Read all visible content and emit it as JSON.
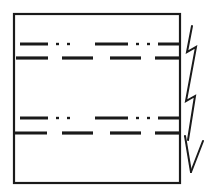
{
  "figure": {
    "title": "Hand-drawn sketch of a rectangular region with dash-dot stratification lines and a downward zigzag arrow",
    "kind": "line-drawing",
    "background_color": "#ffffff",
    "ink_color": "#1a1a1a",
    "canvas": {
      "width": 214,
      "height": 192
    }
  },
  "elements": {
    "frame": {
      "label": "rectangular outline box",
      "x": 14,
      "y": 14,
      "width": 166,
      "height": 169,
      "stroke_width": 2.2,
      "stroke_color": "#1a1a1a",
      "fill": "none"
    },
    "line_rows": [
      {
        "name": "dash-dot-dot-line-upper",
        "pattern": "dash-dot-dot",
        "y": 44,
        "stroke_width": 3.0,
        "segments": [
          {
            "type": "dash",
            "x1": 20,
            "x2": 48
          },
          {
            "type": "dot",
            "x1": 56,
            "x2": 59
          },
          {
            "type": "dot",
            "x1": 67,
            "x2": 70
          },
          {
            "type": "dash",
            "x1": 95,
            "x2": 128
          },
          {
            "type": "dot",
            "x1": 136,
            "x2": 139
          },
          {
            "type": "dot",
            "x1": 147,
            "x2": 150
          },
          {
            "type": "dash",
            "x1": 158,
            "x2": 179
          }
        ]
      },
      {
        "name": "dashed-line-upper",
        "pattern": "dashed",
        "y": 58,
        "stroke_width": 3.2,
        "segments": [
          {
            "type": "dash",
            "x1": 16,
            "x2": 48
          },
          {
            "type": "dash",
            "x1": 62,
            "x2": 93
          },
          {
            "type": "dash",
            "x1": 110,
            "x2": 141
          },
          {
            "type": "dash",
            "x1": 155,
            "x2": 179
          }
        ]
      },
      {
        "name": "dash-dot-dot-line-lower",
        "pattern": "dash-dot-dot",
        "y": 118,
        "stroke_width": 3.0,
        "segments": [
          {
            "type": "dash",
            "x1": 20,
            "x2": 48
          },
          {
            "type": "dot",
            "x1": 56,
            "x2": 59
          },
          {
            "type": "dot",
            "x1": 67,
            "x2": 70
          },
          {
            "type": "dash",
            "x1": 95,
            "x2": 128
          },
          {
            "type": "dot",
            "x1": 136,
            "x2": 139
          },
          {
            "type": "dot",
            "x1": 147,
            "x2": 150
          },
          {
            "type": "dash",
            "x1": 158,
            "x2": 179
          }
        ]
      },
      {
        "name": "dashed-line-lower",
        "pattern": "dashed",
        "y": 133,
        "stroke_width": 3.2,
        "segments": [
          {
            "type": "dash",
            "x1": 14,
            "x2": 47
          },
          {
            "type": "dash",
            "x1": 62,
            "x2": 93
          },
          {
            "type": "dash",
            "x1": 110,
            "x2": 141
          },
          {
            "type": "dash",
            "x1": 155,
            "x2": 179
          }
        ]
      }
    ],
    "zigzag_arrow": {
      "name": "downward-zigzag-arrow",
      "direction": "down",
      "stroke_width": 2.0,
      "stroke_color": "#1a1a1a",
      "shaft_path": "M 192 26 L 187 52 L 196 47 L 186 101 L 195 96 L 188 140",
      "arrowhead_left_path": "M 185 136 L 191 172",
      "arrowhead_right_path": "M 203 141 L 191 172",
      "tip": {
        "x": 191,
        "y": 172
      }
    }
  }
}
